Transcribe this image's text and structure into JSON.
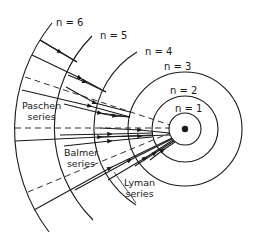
{
  "diagram": {
    "type": "Bohr model hydrogen spectral series",
    "levels": [
      {
        "label": "n = 1",
        "n": 1
      },
      {
        "label": "n = 2",
        "n": 2
      },
      {
        "label": "n = 3",
        "n": 3
      },
      {
        "label": "n = 4",
        "n": 4
      },
      {
        "label": "n = 5",
        "n": 5
      },
      {
        "label": "n = 6",
        "n": 6
      }
    ],
    "series": [
      {
        "name": "Paschen",
        "line1": "Paschen",
        "line2": "series"
      },
      {
        "name": "Balmer",
        "line1": "Balmer",
        "line2": "series"
      },
      {
        "name": "Lyman",
        "line1": "Lyman",
        "line2": "series"
      }
    ],
    "colors": {
      "line": "#1a1a1a",
      "background": "#ffffff"
    }
  }
}
